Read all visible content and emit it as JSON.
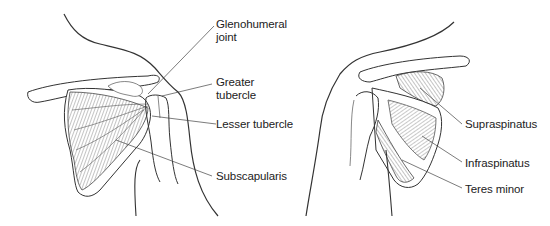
{
  "figure": {
    "anterior_view": {
      "labels": [
        {
          "id": "glenohumeral",
          "line1": "Glenohumeral",
          "line2": "joint"
        },
        {
          "id": "greater-tubercle",
          "line1": "Greater",
          "line2": "tubercle"
        },
        {
          "id": "lesser-tubercle",
          "line1": "Lesser tubercle"
        },
        {
          "id": "subscapularis",
          "line1": "Subscapularis"
        }
      ]
    },
    "posterior_view": {
      "labels": [
        {
          "id": "supraspinatus",
          "line1": "Supraspinatus"
        },
        {
          "id": "infraspinatus",
          "line1": "Infraspinatus"
        },
        {
          "id": "teres-minor",
          "line1": "Teres minor"
        }
      ]
    },
    "colors": {
      "line": "#333333",
      "hatch": "#555555",
      "background": "#ffffff"
    }
  }
}
